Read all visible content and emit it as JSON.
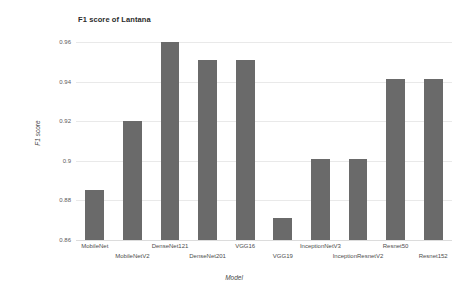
{
  "chart_data": {
    "type": "bar",
    "title": "F1 score of Lantana",
    "xlabel": "Model",
    "ylabel": "F1 score",
    "categories": [
      "MobileNet",
      "MobileNetV2",
      "DenseNet121",
      "DenseNet201",
      "VGG16",
      "VGG19",
      "InceptionNetV3",
      "InceptionResnetV2",
      "Resnet50",
      "Resnet152"
    ],
    "values": [
      0.885,
      0.92,
      0.96,
      0.951,
      0.951,
      0.871,
      0.901,
      0.901,
      0.9415,
      0.9415
    ],
    "ylim": [
      0.86,
      0.965
    ],
    "yticks": [
      0.86,
      0.88,
      0.9,
      0.92,
      0.94,
      0.96
    ],
    "ytick_labels": [
      "0.86",
      "0.88",
      "0.9",
      "0.92",
      "0.94",
      "0.96"
    ],
    "grid": true,
    "legend": false,
    "bar_color": "#6a6a6a",
    "background_color": "#ffffff",
    "gridline_color": "#e9e9e9"
  }
}
